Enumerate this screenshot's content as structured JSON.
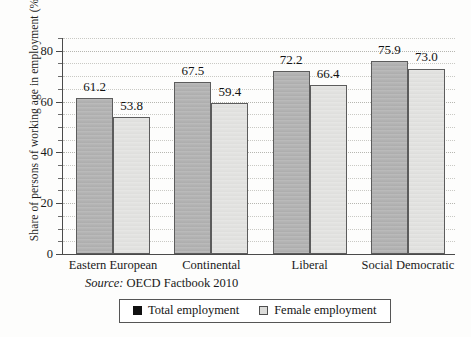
{
  "chart_data": {
    "type": "bar",
    "title": "",
    "xlabel": "",
    "ylabel": "Share of persons of working age in employment (%)",
    "ylim": [
      0,
      85
    ],
    "ytick_values": [
      0,
      20,
      40,
      60,
      80
    ],
    "ytick_labels": [
      "0",
      "20",
      "40",
      "60",
      "80"
    ],
    "minor_tick_step": 5,
    "grid": true,
    "grid_style": "dotted",
    "legend_position": "bottom-center",
    "categories": [
      "Eastern European",
      "Continental",
      "Liberal",
      "Social Democratic"
    ],
    "series": [
      {
        "name": "Total employment",
        "color": "#b3b3b3",
        "values": [
          61.2,
          67.5,
          72.2,
          75.9
        ],
        "labels": [
          "61.2",
          "67.5",
          "72.2",
          "75.9"
        ]
      },
      {
        "name": "Female employment",
        "color": "#e2e2e0",
        "values": [
          53.8,
          59.4,
          66.4,
          73.0
        ],
        "labels": [
          "53.8",
          "59.4",
          "66.4",
          "73.0"
        ]
      }
    ]
  },
  "source": {
    "label": "Source:",
    "text": "OECD Factbook 2010"
  },
  "legend": {
    "items": [
      {
        "label": "Total employment",
        "swatch": "filled-black-square"
      },
      {
        "label": "Female employment",
        "swatch": "light-gray-square"
      }
    ]
  },
  "colors": {
    "total_bar": "#b3b3b3",
    "female_bar": "#e2e2e0",
    "bar_border": "#5c5c5c",
    "axis": "#4a4a4a",
    "grid": "#c9c9c4",
    "text": "#1a1a1a",
    "background": "#fdfdfc"
  }
}
